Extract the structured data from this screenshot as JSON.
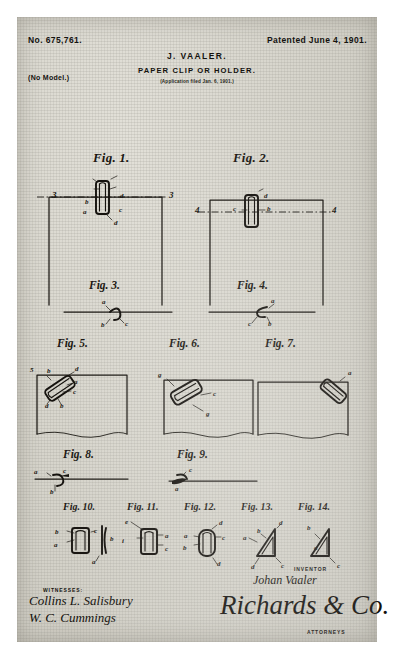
{
  "document": {
    "patent_number": "No. 675,761.",
    "patented_date": "Patented June 4, 1901.",
    "inventor_name": "J. VAALER.",
    "title": "PAPER CLIP OR HOLDER.",
    "application_line": "(Application filed Jan. 6, 1901.)",
    "model_note": "(No Model.)"
  },
  "figures": [
    {
      "id": "fig1",
      "caption": "Fig. 1.",
      "section_marks": [
        "3",
        "3"
      ],
      "ref_letters": [
        "b",
        "d",
        "a",
        "c",
        "d"
      ]
    },
    {
      "id": "fig2",
      "caption": "Fig. 2.",
      "section_marks": [
        "4",
        "4"
      ],
      "ref_letters": [
        "d",
        "c",
        "b"
      ]
    },
    {
      "id": "fig3",
      "caption": "Fig. 3.",
      "ref_letters": [
        "a",
        "b",
        "c"
      ]
    },
    {
      "id": "fig4",
      "caption": "Fig. 4.",
      "ref_letters": [
        "a",
        "c",
        "b"
      ]
    },
    {
      "id": "fig5",
      "caption": "Fig. 5.",
      "section_marks": [
        "5"
      ],
      "ref_letters": [
        "b",
        "d",
        "a",
        "c",
        "d",
        "b"
      ]
    },
    {
      "id": "fig6",
      "caption": "Fig. 6.",
      "ref_letters": [
        "g",
        "c",
        "g"
      ]
    },
    {
      "id": "fig7",
      "caption": "Fig. 7.",
      "ref_letters": [
        "a"
      ]
    },
    {
      "id": "fig8",
      "caption": "Fig. 8.",
      "ref_letters": [
        "a",
        "c",
        "b"
      ]
    },
    {
      "id": "fig9",
      "caption": "Fig. 9.",
      "ref_letters": [
        "c",
        "a"
      ]
    },
    {
      "id": "fig10",
      "caption": "Fig. 10.",
      "ref_letters": [
        "b",
        "a",
        "c",
        "b",
        "a"
      ]
    },
    {
      "id": "fig11",
      "caption": "Fig. 11.",
      "ref_letters": [
        "e",
        "i",
        "a",
        "c"
      ]
    },
    {
      "id": "fig12",
      "caption": "Fig. 12.",
      "ref_letters": [
        "d",
        "a",
        "c",
        "b",
        "d"
      ]
    },
    {
      "id": "fig13",
      "caption": "Fig. 13.",
      "ref_letters": [
        "b",
        "d",
        "a",
        "d",
        "c"
      ]
    },
    {
      "id": "fig14",
      "caption": "Fig. 14.",
      "ref_letters": [
        "b",
        "a",
        "c"
      ]
    }
  ],
  "signatures": {
    "witnesses_label": "WITNESSES:",
    "witness_1": "Collins L. Salisbury",
    "witness_2": "W. C. Cummings",
    "inventor_label": "INVENTOR",
    "inventor_signature": "Johan Vaaler",
    "attorneys_label": "ATTORNEYS",
    "attorney_signature": "Richards & Co."
  },
  "colors": {
    "paper": "#d9d7cf",
    "ink": "#14120f",
    "page_background": "#ffffff"
  }
}
